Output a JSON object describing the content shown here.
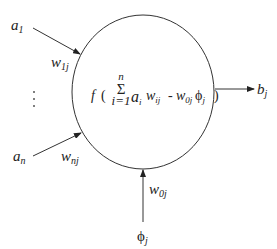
{
  "diagram": {
    "type": "neuron-model",
    "inputs": [
      {
        "label": "a",
        "sub": "1",
        "weight": "w",
        "weight_sub": "1j"
      },
      {
        "label": "a",
        "sub": "n",
        "weight": "w",
        "weight_sub": "nj"
      }
    ],
    "ellipsis": "⋮",
    "bias": {
      "label": "ϕ",
      "sub": "j",
      "weight": "w",
      "weight_sub": "0j"
    },
    "output": {
      "label": "b",
      "sub": "j"
    },
    "formula": {
      "f": "f",
      "open": "(",
      "sigma": "Σ",
      "sigma_top": "n",
      "sigma_bottom": "i=1",
      "term_a": "a",
      "term_a_sub": "i",
      "term_w": "w",
      "term_w_sub": "ij",
      "minus": "-",
      "bias_w": "w",
      "bias_w_sub": "0j",
      "bias_phi": "ϕ",
      "bias_phi_sub": "j",
      "close": ")"
    },
    "colors": {
      "stroke": "#333333",
      "background": "#ffffff"
    }
  }
}
